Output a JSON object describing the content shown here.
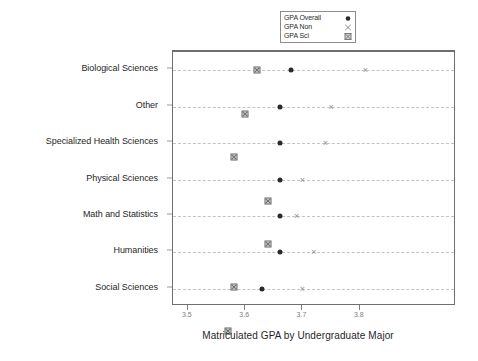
{
  "chart": {
    "type": "scatter",
    "title": "",
    "xlabel": "Matriculated GPA by Undergraduate Major",
    "ylabel": ""
  },
  "legend": {
    "position": "top-center",
    "entries": [
      {
        "label": "GPA Overall",
        "marker": "filled-circle",
        "marker_glyph": "●",
        "color": "#2a2a2a"
      },
      {
        "label": "GPA Non",
        "marker": "cross-x",
        "marker_glyph": "×",
        "color": "#8e8e8e"
      },
      {
        "label": "GPA Sci",
        "marker": "crossed-square",
        "marker_glyph": "⊠",
        "color": "#7d7d7d"
      }
    ]
  },
  "axis": {
    "x_ticks": [
      "3.5",
      "3.6",
      "3.7",
      "3.8"
    ],
    "x_tick_values": [
      3.5,
      3.6,
      3.7,
      3.8
    ],
    "x_min": 3.474,
    "x_max": 3.968,
    "grid": "horizontal-dashed"
  },
  "chart_data": {
    "type": "scatter",
    "title": "",
    "xlabel": "Matriculated GPA by Undergraduate Major",
    "ylabel": "",
    "xlim": [
      3.474,
      3.968
    ],
    "xticks": [
      3.5,
      3.6,
      3.7,
      3.8
    ],
    "grid": true,
    "legend_position": "top-center",
    "categories": [
      "Biological Sciences",
      "Other",
      "Specialized Health Sciences",
      "Physical Sciences",
      "Math and Statistics",
      "Humanities",
      "Social Sciences"
    ],
    "series": [
      {
        "name": "GPA Overall",
        "marker": "filled-circle",
        "values": [
          3.68,
          3.66,
          3.66,
          3.66,
          3.66,
          3.66,
          3.63
        ]
      },
      {
        "name": "GPA Non",
        "marker": "cross-x",
        "values": [
          3.81,
          3.75,
          3.74,
          3.7,
          3.69,
          3.72,
          3.7
        ]
      },
      {
        "name": "GPA Sci",
        "marker": "crossed-square",
        "values": [
          3.62,
          3.6,
          3.58,
          3.64,
          3.64,
          3.58,
          3.57
        ]
      }
    ]
  }
}
